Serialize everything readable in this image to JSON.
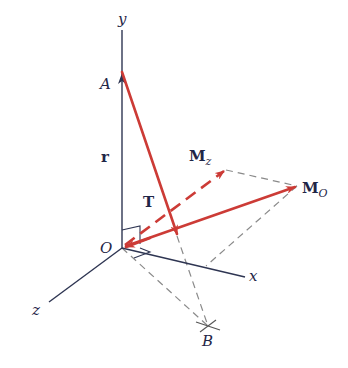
{
  "diagram": {
    "type": "3d-vector-moment-diagram",
    "axes": {
      "y": "y",
      "x": "x",
      "z": "z"
    },
    "points": {
      "origin": "O",
      "a": "A",
      "b": "B"
    },
    "vectors": {
      "position": "r",
      "force": "T",
      "moment_total": {
        "main": "M",
        "sub": "O"
      },
      "moment_z": {
        "main": "M",
        "sub": "z"
      }
    },
    "colors": {
      "vector": "#cc3b36",
      "axis": "#2e3552",
      "construction": "#8a8a8a",
      "label": "#1f2647"
    }
  }
}
